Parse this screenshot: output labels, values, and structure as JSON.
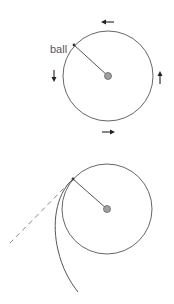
{
  "figure": {
    "top_diagram": {
      "label": "ball",
      "description": "ball on string circling center, arrows show counterclockwise direction",
      "arrows": [
        {
          "position": "top",
          "direction": "left"
        },
        {
          "position": "left",
          "direction": "down"
        },
        {
          "position": "bottom",
          "direction": "right"
        },
        {
          "position": "right",
          "direction": "up"
        }
      ]
    },
    "bottom_diagram": {
      "description": "string released: ball follows curved path; dashed tangent line shows straight-line path"
    },
    "colors": {
      "line": "#555555",
      "center_fill": "#a0a0a0",
      "dashed": "#888888"
    }
  }
}
